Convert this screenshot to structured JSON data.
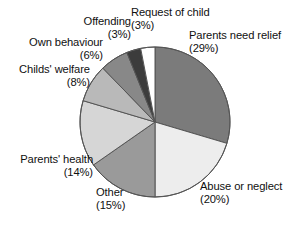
{
  "chart_data": {
    "type": "pie",
    "title": "",
    "subtitle": "",
    "xlabel": "",
    "ylabel": "",
    "legend_position": "none",
    "grid": false,
    "value_unit": "percent",
    "start_angle_deg": 0,
    "direction": "clockwise",
    "center": {
      "x": 155,
      "y": 122
    },
    "radius": 75,
    "outline_color": "#555555",
    "categories": [
      "Parents need relief",
      "Abuse or neglect",
      "Other",
      "Parents' health",
      "Childs' welfare",
      "Own behaviour",
      "Offending",
      "Request of child"
    ],
    "values": [
      29,
      20,
      15,
      14,
      8,
      6,
      3,
      3
    ],
    "colors": [
      "#7b7b7b",
      "#ededed",
      "#9a9a9a",
      "#d6d6d6",
      "#b9b9b9",
      "#888888",
      "#3c3c3c",
      "#ffffff"
    ],
    "slices": [
      {
        "name": "parents-need-relief",
        "label": "Parents need relief",
        "percent_text": "(29%)",
        "value": 29,
        "color": "#7b7b7b"
      },
      {
        "name": "abuse-or-neglect",
        "label": "Abuse or neglect",
        "percent_text": "(20%)",
        "value": 20,
        "color": "#ededed"
      },
      {
        "name": "other",
        "label": "Other",
        "percent_text": "(15%)",
        "value": 15,
        "color": "#9a9a9a"
      },
      {
        "name": "parents-health",
        "label": "Parents' health",
        "percent_text": "(14%)",
        "value": 14,
        "color": "#d6d6d6"
      },
      {
        "name": "childs-welfare",
        "label": "Childs' welfare",
        "percent_text": "(8%)",
        "value": 8,
        "color": "#b9b9b9"
      },
      {
        "name": "own-behaviour",
        "label": "Own behaviour",
        "percent_text": "(6%)",
        "value": 6,
        "color": "#888888"
      },
      {
        "name": "offending",
        "label": "Offending",
        "percent_text": "(3%)",
        "value": 3,
        "color": "#3c3c3c"
      },
      {
        "name": "request-of-child",
        "label": "Request of child",
        "percent_text": "(3%)",
        "value": 3,
        "color": "#ffffff"
      }
    ]
  }
}
